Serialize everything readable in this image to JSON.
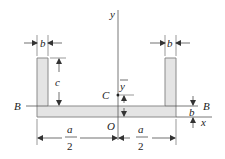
{
  "diagram": {
    "type": "channel-section-cross-section",
    "labels": {
      "b_left": "b",
      "b_right": "b",
      "b_bottom": "b",
      "c": "c",
      "y_axis": "y",
      "x_axis": "x",
      "centroid": "C",
      "y_bar": "y",
      "origin": "O",
      "B_left": "B",
      "B_right": "B",
      "a_num_left": "a",
      "a_den_left": "2",
      "a_num_right": "a",
      "a_den_right": "2"
    },
    "colors": {
      "fill": "#e4e4e4",
      "stroke": "#8a8a8a",
      "line": "#333333"
    }
  }
}
